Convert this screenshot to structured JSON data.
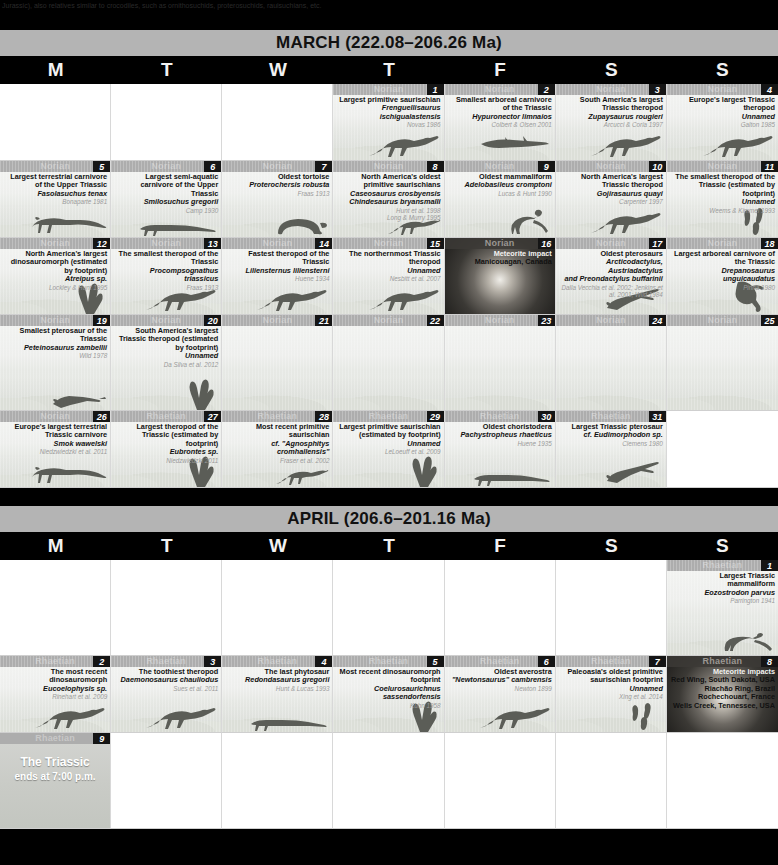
{
  "top_caption": "Jurassic), also relatives similar to crocodiles, such as ornithosuchids, proterosuchids, rauisuchians, etc.",
  "months": [
    {
      "name": "MARCH",
      "title": "MARCH (222.08–206.26 Ma)",
      "range": "222.08–206.26 Ma",
      "dow": [
        "M",
        "T",
        "W",
        "T",
        "F",
        "S",
        "S"
      ],
      "weeks": [
        [
          {
            "kind": "blank"
          },
          {
            "kind": "blank"
          },
          {
            "kind": "blank"
          },
          {
            "kind": "day",
            "num": "1",
            "stage": "Norian",
            "title": "Largest primitive saurischian",
            "sci": "Frenguellisaurus ischigualastensis",
            "ref": "Novas 1986",
            "art": "theropod"
          },
          {
            "kind": "day",
            "num": "2",
            "stage": "Norian",
            "title": "Smallest arboreal carnivore of the Triassic",
            "sci": "Hypuronector limnaios",
            "ref": "Colbert & Olsen 2001",
            "art": "glider"
          },
          {
            "kind": "day",
            "num": "3",
            "stage": "Norian",
            "title": "South America's largest Triassic theropod",
            "sci": "Zupaysaurus rougieri",
            "ref": "Arcucci & Coria 1997",
            "art": "theropod"
          },
          {
            "kind": "day",
            "num": "4",
            "stage": "Norian",
            "title": "Europe's largest Triassic theropod",
            "sci": "Unnamed",
            "ref": "Galton 1985",
            "art": "theropod"
          }
        ],
        [
          {
            "kind": "day",
            "num": "5",
            "stage": "Norian",
            "title": "Largest terrestrial carnivore of the Upper Triassic",
            "sci": "Fasolasuchus tenax",
            "ref": "Bonaparte 1981",
            "art": "rauisuchian"
          },
          {
            "kind": "day",
            "num": "6",
            "stage": "Norian",
            "title": "Largest semi-aquatic carnivore of the Upper Triassic",
            "sci": "Smilosuchus gregorii",
            "ref": "Camp 1930",
            "art": "phytosaur"
          },
          {
            "kind": "day",
            "num": "7",
            "stage": "Norian",
            "title": "Oldest tortoise",
            "sci": "Proterochersis robusta",
            "ref": "Fraas 1913",
            "art": "turtle"
          },
          {
            "kind": "day",
            "num": "8",
            "stage": "Norian",
            "title": "North America's oldest primitive saurischians",
            "sci": "Caseosaurus crosbyensis",
            "sci2": "Chindesaurus bryansmalli",
            "ref": "Hunt et al. 1998",
            "ref2": "Long & Murry 1995",
            "art": "theropod-small"
          },
          {
            "kind": "day",
            "num": "9",
            "stage": "Norian",
            "title": "Oldest mammaliform",
            "sci": "Adelobasileus cromptoni",
            "ref": "Lucas & Hunt 1990",
            "art": "mammal"
          },
          {
            "kind": "day",
            "num": "10",
            "stage": "Norian",
            "title": "North America's largest Triassic theropod",
            "sci": "Gojirasaurus quayi",
            "ref": "Carpenter 1997",
            "art": "theropod"
          },
          {
            "kind": "day",
            "num": "11",
            "stage": "Norian",
            "title": "The smallest theropod of the Triassic (estimated by footprint)",
            "sci": "Unnamed",
            "ref": "Weems & Kimmel 1993",
            "art": "footprint3"
          }
        ],
        [
          {
            "kind": "day",
            "num": "12",
            "stage": "Norian",
            "title": "North America's largest dinosauromorph (estimated by footprint)",
            "sci": "Atreipus sp.",
            "ref": "Lockley & Hunt 1995",
            "art": "footprint"
          },
          {
            "kind": "day",
            "num": "13",
            "stage": "Norian",
            "title": "The smallest theropod of the Triassic",
            "sci": "Procompsognathus triassicus",
            "ref": "Fraas 1913",
            "art": "theropod"
          },
          {
            "kind": "day",
            "num": "14",
            "stage": "Norian",
            "title": "Fastest theropod of the Triassic",
            "sci": "Liliensternus liliensterni",
            "ref": "Huene 1934",
            "art": "theropod"
          },
          {
            "kind": "day",
            "num": "15",
            "stage": "Norian",
            "title": "The northernmost Triassic theropod",
            "sci": "Unnamed",
            "ref": "Nesbitt et al. 2007",
            "art": "theropod"
          },
          {
            "kind": "impact",
            "num": "16",
            "stage": "Norian",
            "title": "Meteorite impact",
            "sci": "",
            "extra": "Manicouagan, Canada",
            "ref": ""
          },
          {
            "kind": "day",
            "num": "17",
            "stage": "Norian",
            "title": "Oldest pterosaurs",
            "sci": "Arcticodactylus, Austriadactylus",
            "sci2": "and Preondactylus buffarinii",
            "ref": "Dalla Vecchia et al. 2002; Jenkins et al. 2001; Wild 1984",
            "art": "pterosaur"
          },
          {
            "kind": "day",
            "num": "18",
            "stage": "Norian",
            "title": "Largest arboreal carnivore of the Triassic",
            "sci": "Drepanosaurus unguicaudatus",
            "ref": "Pinna 1980",
            "art": "drepanosaur"
          }
        ],
        [
          {
            "kind": "day",
            "num": "19",
            "stage": "Norian",
            "title": "Smallest pterosaur of the Triassic",
            "sci": "Peteinosaurus zambellii",
            "ref": "Wild 1978",
            "art": "pterosaur-small"
          },
          {
            "kind": "day",
            "num": "20",
            "stage": "Norian",
            "title": "South America's largest Triassic theropod (estimated by footprint)",
            "sci": "Unnamed",
            "ref": "Da Silva et al. 2012",
            "art": "footprint"
          },
          {
            "kind": "empty",
            "num": "21",
            "stage": "Norian"
          },
          {
            "kind": "empty",
            "num": "22",
            "stage": "Norian"
          },
          {
            "kind": "empty",
            "num": "23",
            "stage": "Norian"
          },
          {
            "kind": "empty",
            "num": "24",
            "stage": "Norian"
          },
          {
            "kind": "empty",
            "num": "25",
            "stage": "Norian"
          }
        ],
        [
          {
            "kind": "day",
            "num": "26",
            "stage": "Norian",
            "title": "Europe's largest terrestrial Triassic carnivore",
            "sci": "Smok wawelski",
            "ref": "Niedzwiedzki et al. 2011",
            "art": "rauisuchian"
          },
          {
            "kind": "day",
            "num": "27",
            "stage": "Rhaetian",
            "title": "Largest theropod of the Triassic (estimated by footprint)",
            "sci": "Eubrontes sp.",
            "ref": "Niedzwiedzki 2011",
            "art": "footprint"
          },
          {
            "kind": "day",
            "num": "28",
            "stage": "Rhaetian",
            "title": "Most recent primitive saurischian",
            "sci": "cf. \"Agnosphitys cromhallensis\"",
            "ref": "Fraser et al. 2002",
            "art": "theropod-small"
          },
          {
            "kind": "day",
            "num": "29",
            "stage": "Rhaetian",
            "title": "Largest primitive saurischian (estimated by footprint)",
            "sci": "Unnamed",
            "ref": "LeLoeuff et al. 2009",
            "art": "footprint"
          },
          {
            "kind": "day",
            "num": "30",
            "stage": "Rhaetian",
            "title": "Oldest choristodera",
            "sci": "Pachystropheus rhaeticus",
            "ref": "Huene 1935",
            "art": "phytosaur"
          },
          {
            "kind": "day",
            "num": "31",
            "stage": "Rhaetian",
            "title": "Largest Triassic pterosaur",
            "sci": "cf. Eudimorphodon sp.",
            "ref": "Clemens 1980",
            "art": "pterosaur"
          },
          {
            "kind": "blank"
          }
        ]
      ]
    },
    {
      "name": "APRIL",
      "title": "APRIL (206.6–201.16 Ma)",
      "range": "206.6–201.16 Ma",
      "dow": [
        "M",
        "T",
        "W",
        "T",
        "F",
        "S",
        "S"
      ],
      "weeks": [
        [
          {
            "kind": "blank"
          },
          {
            "kind": "blank"
          },
          {
            "kind": "blank"
          },
          {
            "kind": "blank"
          },
          {
            "kind": "blank"
          },
          {
            "kind": "blank"
          },
          {
            "kind": "day",
            "num": "1",
            "stage": "Rhaetian",
            "title": "Largest Triassic mammaliform",
            "sci": "Eozostrodon parvus",
            "ref": "Parrington 1941",
            "art": "mammal2"
          }
        ],
        [
          {
            "kind": "day",
            "num": "2",
            "stage": "Rhaetian",
            "title": "The most recent dinosauromorph",
            "sci": "Eucoelophysis sp.",
            "ref": "Rinehart et al. 2009",
            "art": "theropod"
          },
          {
            "kind": "day",
            "num": "3",
            "stage": "Rhaetian",
            "title": "The toothiest theropod",
            "sci": "Daemonosaurus chauliodus",
            "ref": "Sues et al. 2011",
            "art": "theropod"
          },
          {
            "kind": "day",
            "num": "4",
            "stage": "Rhaetian",
            "title": "The last phytosaur",
            "sci": "Redondasaurus gregorii",
            "ref": "Hunt & Lucas 1993",
            "art": "phytosaur"
          },
          {
            "kind": "day",
            "num": "5",
            "stage": "Rhaetian",
            "title": "Most recent dinosauromorph footprint",
            "sci": "Coelurosaurichnus sassendorfensis",
            "ref": "Kuhn 1958",
            "art": "footprint"
          },
          {
            "kind": "day",
            "num": "6",
            "stage": "Rhaetian",
            "title": "Oldest averostra",
            "sci": "\"Newtonsaurus\" cambrensis",
            "ref": "Newton 1899",
            "art": "theropod"
          },
          {
            "kind": "day",
            "num": "7",
            "stage": "Rhaetian",
            "title": "Paleoasia's oldest primitive saurischian footprint",
            "sci": "Unnamed",
            "ref": "Xing et al. 2014",
            "art": "footprint3"
          },
          {
            "kind": "impact",
            "num": "8",
            "stage": "Rhaetian",
            "title": "Meteorite impacts",
            "sci": "",
            "extra": "Red Wing, South Dakota, USA\nRiachão Ring, Brazil\nRochechouart, France\nWells Creek, Tennessee, USA",
            "ref": ""
          }
        ],
        [
          {
            "kind": "end",
            "num": "9",
            "stage": "Rhaetian",
            "end_line1": "The Triassic",
            "end_line2": "ends at 7:00 p.m."
          },
          {
            "kind": "blank"
          },
          {
            "kind": "blank"
          },
          {
            "kind": "blank"
          },
          {
            "kind": "blank"
          },
          {
            "kind": "blank"
          },
          {
            "kind": "blank"
          }
        ]
      ]
    }
  ]
}
